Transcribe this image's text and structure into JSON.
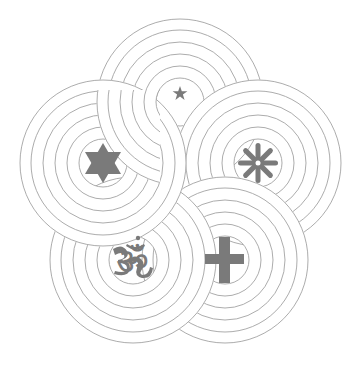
{
  "figure": {
    "colors": {
      "line": "#a3a3a3",
      "symbol": "#7a7a7a",
      "background": "#ffffff"
    },
    "ring_radii": [
      24,
      36,
      48,
      60,
      72,
      83
    ],
    "units": [
      {
        "name": "crescent-and-star",
        "cx": 180,
        "cy": 102
      },
      {
        "name": "wheel",
        "cx": 258,
        "cy": 163
      },
      {
        "name": "cross",
        "cx": 225,
        "cy": 260
      },
      {
        "name": "om",
        "cx": 133,
        "cy": 260
      },
      {
        "name": "star-of-david",
        "cx": 103,
        "cy": 163
      }
    ]
  }
}
